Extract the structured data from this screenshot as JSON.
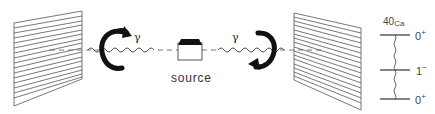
{
  "diagram": {
    "source_label": "source",
    "photon_left_label": "γ",
    "photon_right_label": "γ",
    "nucleus": {
      "mass_number": "40",
      "symbol": "Ca"
    },
    "levels": [
      {
        "spin": "0",
        "parity": "+"
      },
      {
        "spin": "1",
        "parity": "−"
      },
      {
        "spin": "0",
        "parity": "+"
      }
    ],
    "colors": {
      "line": "#444444",
      "arrow": "#111111",
      "hatch": "#555555"
    }
  }
}
